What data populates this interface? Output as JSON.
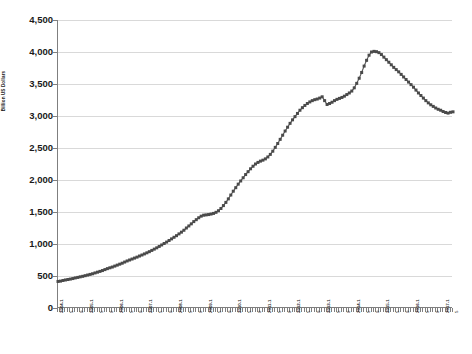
{
  "chart_data": {
    "type": "line",
    "title": "",
    "subtitle": "",
    "xlabel": "",
    "ylabel": "Billion US Dollars",
    "ylim": [
      0,
      4500
    ],
    "ytick_values": [
      0,
      500,
      1000,
      1500,
      2000,
      2500,
      3000,
      3500,
      4000,
      4500
    ],
    "ytick_labels": [
      "0",
      "500",
      "1,000",
      "1,500",
      "2,000",
      "2,500",
      "3,000",
      "3,500",
      "4,000",
      "4,500"
    ],
    "grid": "horizontal",
    "legend": "none",
    "marker": "square",
    "marker_color": "#4a4a4a",
    "line_color": "#595959",
    "x_tick_interval_months": 4,
    "x_start": "2004-1",
    "x_end": "2017-5",
    "xtick_labels": [
      "2004-1",
      "5",
      "9",
      "2005-1",
      "5",
      "9",
      "2006-1",
      "5",
      "9",
      "2007-1",
      "5",
      "9",
      "2008-1",
      "5",
      "9",
      "2009-1",
      "5",
      "9",
      "2010-1",
      "5",
      "9",
      "2011-1",
      "5",
      "9",
      "2012-1",
      "5",
      "9",
      "2013-1",
      "5",
      "9",
      "2014-1",
      "5",
      "9",
      "2015-1",
      "5",
      "9",
      "2016-1",
      "5",
      "9",
      "2017-1",
      "5"
    ],
    "x": [
      "2004-1",
      "2004-2",
      "2004-3",
      "2004-4",
      "2004-5",
      "2004-6",
      "2004-7",
      "2004-8",
      "2004-9",
      "2004-10",
      "2004-11",
      "2004-12",
      "2005-1",
      "2005-2",
      "2005-3",
      "2005-4",
      "2005-5",
      "2005-6",
      "2005-7",
      "2005-8",
      "2005-9",
      "2005-10",
      "2005-11",
      "2005-12",
      "2006-1",
      "2006-2",
      "2006-3",
      "2006-4",
      "2006-5",
      "2006-6",
      "2006-7",
      "2006-8",
      "2006-9",
      "2006-10",
      "2006-11",
      "2006-12",
      "2007-1",
      "2007-2",
      "2007-3",
      "2007-4",
      "2007-5",
      "2007-6",
      "2007-7",
      "2007-8",
      "2007-9",
      "2007-10",
      "2007-11",
      "2007-12",
      "2008-1",
      "2008-2",
      "2008-3",
      "2008-4",
      "2008-5",
      "2008-6",
      "2008-7",
      "2008-8",
      "2008-9",
      "2008-10",
      "2008-11",
      "2008-12",
      "2009-1",
      "2009-2",
      "2009-3",
      "2009-4",
      "2009-5",
      "2009-6",
      "2009-7",
      "2009-8",
      "2009-9",
      "2009-10",
      "2009-11",
      "2009-12",
      "2010-1",
      "2010-2",
      "2010-3",
      "2010-4",
      "2010-5",
      "2010-6",
      "2010-7",
      "2010-8",
      "2010-9",
      "2010-10",
      "2010-11",
      "2010-12",
      "2011-1",
      "2011-2",
      "2011-3",
      "2011-4",
      "2011-5",
      "2011-6",
      "2011-7",
      "2011-8",
      "2011-9",
      "2011-10",
      "2011-11",
      "2011-12",
      "2012-1",
      "2012-2",
      "2012-3",
      "2012-4",
      "2012-5",
      "2012-6",
      "2012-7",
      "2012-8",
      "2012-9",
      "2012-10",
      "2012-11",
      "2012-12",
      "2013-1",
      "2013-2",
      "2013-3",
      "2013-4",
      "2013-5",
      "2013-6",
      "2013-7",
      "2013-8",
      "2013-9",
      "2013-10",
      "2013-11",
      "2013-12",
      "2014-1",
      "2014-2",
      "2014-3",
      "2014-4",
      "2014-5",
      "2014-6",
      "2014-7",
      "2014-8",
      "2014-9",
      "2014-10",
      "2014-11",
      "2014-12",
      "2015-1",
      "2015-2",
      "2015-3",
      "2015-4",
      "2015-5",
      "2015-6",
      "2015-7",
      "2015-8",
      "2015-9",
      "2015-10",
      "2015-11",
      "2015-12",
      "2016-1",
      "2016-2",
      "2016-3",
      "2016-4",
      "2016-5",
      "2016-6",
      "2016-7",
      "2016-8",
      "2016-9",
      "2016-10",
      "2016-11",
      "2016-12",
      "2017-1",
      "2017-2",
      "2017-3",
      "2017-4",
      "2017-5"
    ],
    "values": [
      415,
      420,
      430,
      438,
      445,
      452,
      460,
      470,
      478,
      487,
      495,
      505,
      515,
      525,
      535,
      548,
      560,
      572,
      585,
      600,
      615,
      628,
      640,
      655,
      670,
      685,
      700,
      718,
      735,
      750,
      765,
      780,
      795,
      812,
      828,
      845,
      862,
      880,
      900,
      920,
      940,
      962,
      985,
      1008,
      1030,
      1055,
      1080,
      1105,
      1130,
      1158,
      1185,
      1215,
      1250,
      1282,
      1315,
      1350,
      1380,
      1410,
      1435,
      1450,
      1455,
      1460,
      1468,
      1478,
      1495,
      1520,
      1555,
      1600,
      1650,
      1705,
      1765,
      1825,
      1880,
      1935,
      1985,
      2035,
      2085,
      2130,
      2175,
      2215,
      2250,
      2275,
      2295,
      2310,
      2330,
      2360,
      2400,
      2450,
      2510,
      2570,
      2635,
      2700,
      2765,
      2825,
      2885,
      2940,
      2990,
      3040,
      3090,
      3130,
      3165,
      3195,
      3220,
      3240,
      3255,
      3265,
      3280,
      3300,
      3240,
      3180,
      3195,
      3215,
      3240,
      3260,
      3275,
      3290,
      3310,
      3335,
      3360,
      3390,
      3440,
      3510,
      3590,
      3680,
      3780,
      3870,
      3950,
      4000,
      4010,
      4005,
      3990,
      3960,
      3920,
      3880,
      3840,
      3800,
      3760,
      3725,
      3690,
      3650,
      3610,
      3570,
      3530,
      3490,
      3450,
      3405,
      3360,
      3320,
      3280,
      3240,
      3205,
      3175,
      3150,
      3125,
      3105,
      3090,
      3070,
      3055,
      3045,
      3058,
      3065
    ]
  }
}
